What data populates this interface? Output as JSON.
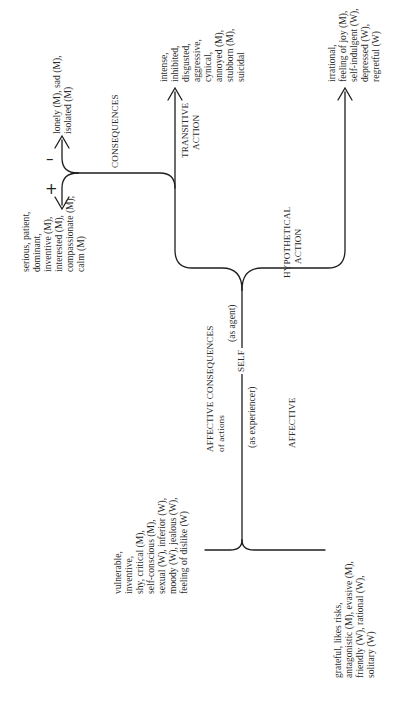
{
  "diagram": {
    "root": {
      "label": "SELF",
      "as_agent": "(as agent)",
      "as_experiencer": "(as experiencer)"
    },
    "agent_branch": {
      "transitive_action": {
        "label_lines": [
          "TRANSITIVE",
          "ACTION"
        ],
        "traits": [
          "intense,",
          "inhibited,",
          "disgusted,",
          "aggressive,",
          "cynical,",
          "annoyed (M),",
          "stubborn (M),",
          "suicidal"
        ],
        "consequences": {
          "label": "CONSEQUENCES",
          "negative": {
            "sign": "–",
            "traits": [
              "lonely (M), sad (M),",
              "isolated (M)"
            ]
          },
          "positive": {
            "sign": "+",
            "traits": [
              "serious, patient,",
              "dominant,",
              "inventive (M),",
              "interested (M),",
              "compassionate (M),",
              "calm (M)"
            ]
          }
        }
      },
      "hypothetical_action": {
        "label_lines": [
          "HYPOTHETICAL",
          "ACTION"
        ],
        "traits": [
          "irrational,",
          "feeling of joy (M),",
          "self-indulgent (W),",
          "depressed (W),",
          "regretful (W)"
        ]
      }
    },
    "experiencer_branch": {
      "affective_consequences": {
        "label_lines": [
          "AFFECTIVE CONSEQUENCES",
          "of actions"
        ],
        "traits": [
          "vulnerable,",
          "inventive,",
          "shy, critical (M),",
          "self-conscious (M),",
          "sexual (W), inferior (W),",
          "moody (W), jealous (W),",
          "feeling of dislike (W)"
        ]
      },
      "affective": {
        "label": "AFFECTIVE",
        "traits": [
          "grateful, likes risks,",
          "antagonistic (M), evasive (M),",
          "friendly (W), rational (W),",
          "solitary (W)"
        ]
      }
    }
  }
}
